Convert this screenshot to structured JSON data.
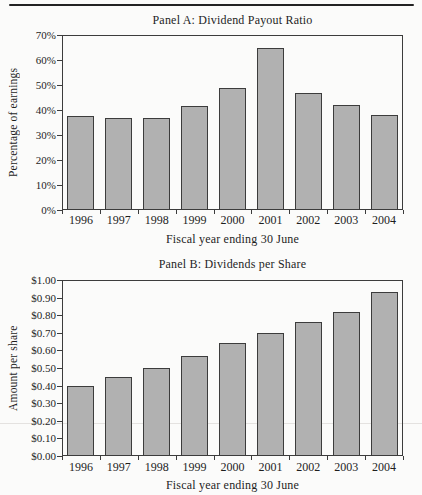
{
  "page": {
    "background": "#fbfbfa",
    "rule_color": "#232323",
    "axis_color": "#3c3c3c",
    "text_color": "#1e1e1e",
    "scan_artifact_line_color": "#e4e2e0"
  },
  "chart_data": [
    {
      "type": "bar",
      "title": "Panel A: Dividend Payout Ratio",
      "xlabel": "Fiscal year ending 30 June",
      "ylabel": "Percentage of earnings",
      "categories": [
        "1996",
        "1997",
        "1998",
        "1999",
        "2000",
        "2001",
        "2002",
        "2003",
        "2004"
      ],
      "values": [
        37.5,
        37,
        37,
        41.5,
        49,
        65,
        47,
        42,
        38
      ],
      "ylim": [
        0,
        70
      ],
      "ytick_values": [
        70,
        60,
        50,
        40,
        30,
        20,
        10,
        0
      ],
      "ytick_labels": [
        "70%",
        "60%",
        "50%",
        "40%",
        "30%",
        "20%",
        "10%",
        "0%"
      ],
      "grid": false,
      "legend": "none",
      "bar_fill": "#b1b1b1",
      "bar_border": "#3c3c3c"
    },
    {
      "type": "bar",
      "title": "Panel B: Dividends per Share",
      "xlabel": "Fiscal year ending 30 June",
      "ylabel": "Amount per share",
      "categories": [
        "1996",
        "1997",
        "1998",
        "1999",
        "2000",
        "2001",
        "2002",
        "2003",
        "2004"
      ],
      "values": [
        0.4,
        0.45,
        0.5,
        0.57,
        0.64,
        0.7,
        0.76,
        0.82,
        0.93
      ],
      "ylim": [
        0,
        1.0
      ],
      "ytick_values": [
        1.0,
        0.9,
        0.8,
        0.7,
        0.6,
        0.5,
        0.4,
        0.3,
        0.2,
        0.1,
        0.0
      ],
      "ytick_labels": [
        "$1.00",
        "$0.90",
        "$0.80",
        "$0.70",
        "$0.60",
        "$0.50",
        "$0.40",
        "$0.30",
        "$0.20",
        "$0.10",
        "$0.00"
      ],
      "grid": false,
      "legend": "none",
      "bar_fill": "#b1b1b1",
      "bar_border": "#3c3c3c"
    }
  ]
}
